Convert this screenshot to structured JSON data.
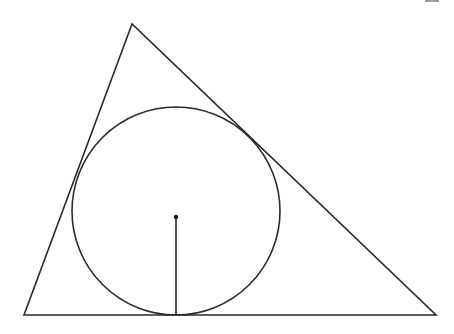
{
  "diagram": {
    "type": "geometry",
    "stroke_color": "#2a2a2a",
    "background": "#ffffff",
    "triangle": {
      "vertices": [
        [
          132,
          24
        ],
        [
          24,
          315
        ],
        [
          436,
          315
        ]
      ]
    },
    "incircle": {
      "center": [
        176,
        211
      ],
      "radius": 104
    },
    "center_point": [
      176,
      217
    ],
    "radius_segment": {
      "from": [
        176,
        217
      ],
      "to": [
        176,
        315
      ]
    }
  }
}
